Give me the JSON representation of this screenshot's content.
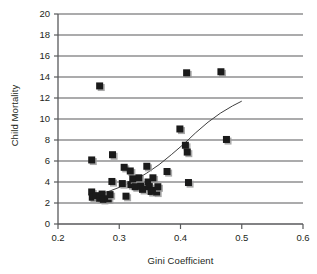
{
  "chart_data": {
    "type": "scatter",
    "title": "",
    "xlabel": "Gini Coefficient",
    "ylabel": "Child Mortality",
    "xlim": [
      0.2,
      0.6
    ],
    "ylim": [
      0,
      20
    ],
    "xticks": [
      "0.2",
      "0.3",
      "0.4",
      "0.5",
      "0.6"
    ],
    "xtick_values": [
      0.2,
      0.3,
      0.4,
      0.5,
      0.6
    ],
    "yticks": [
      "0",
      "2",
      "4",
      "6",
      "8",
      "10",
      "12",
      "14",
      "16",
      "18",
      "20"
    ],
    "ytick_values": [
      0,
      2,
      4,
      6,
      8,
      10,
      12,
      14,
      16,
      18,
      20
    ],
    "grid": "horizontal",
    "legend": "none",
    "marker": "filled-square-with-shadow",
    "marker_color": "#1a1a1a",
    "marker_shadow_color": "#9a9a9a",
    "gridline_color": "#58595b",
    "axis_color": "#58595b",
    "trendline_color": "#3f3f3f",
    "points": [
      {
        "x": 0.255,
        "y": 6.1
      },
      {
        "x": 0.268,
        "y": 13.15
      },
      {
        "x": 0.255,
        "y": 3.05
      },
      {
        "x": 0.256,
        "y": 2.55
      },
      {
        "x": 0.262,
        "y": 2.7
      },
      {
        "x": 0.268,
        "y": 2.45
      },
      {
        "x": 0.272,
        "y": 2.85
      },
      {
        "x": 0.274,
        "y": 2.35
      },
      {
        "x": 0.282,
        "y": 2.4
      },
      {
        "x": 0.285,
        "y": 2.8
      },
      {
        "x": 0.288,
        "y": 4.05
      },
      {
        "x": 0.289,
        "y": 6.6
      },
      {
        "x": 0.305,
        "y": 3.85
      },
      {
        "x": 0.308,
        "y": 5.4
      },
      {
        "x": 0.311,
        "y": 2.65
      },
      {
        "x": 0.318,
        "y": 5.05
      },
      {
        "x": 0.319,
        "y": 3.75
      },
      {
        "x": 0.322,
        "y": 4.3
      },
      {
        "x": 0.326,
        "y": 3.55
      },
      {
        "x": 0.332,
        "y": 4.4
      },
      {
        "x": 0.335,
        "y": 3.6
      },
      {
        "x": 0.338,
        "y": 3.3
      },
      {
        "x": 0.345,
        "y": 5.5
      },
      {
        "x": 0.347,
        "y": 4.0
      },
      {
        "x": 0.349,
        "y": 3.55
      },
      {
        "x": 0.352,
        "y": 3.1
      },
      {
        "x": 0.355,
        "y": 4.4
      },
      {
        "x": 0.358,
        "y": 3.2
      },
      {
        "x": 0.361,
        "y": 3.05
      },
      {
        "x": 0.363,
        "y": 3.55
      },
      {
        "x": 0.378,
        "y": 5.0
      },
      {
        "x": 0.399,
        "y": 9.05
      },
      {
        "x": 0.408,
        "y": 7.5
      },
      {
        "x": 0.41,
        "y": 14.4
      },
      {
        "x": 0.411,
        "y": 6.85
      },
      {
        "x": 0.413,
        "y": 3.95
      },
      {
        "x": 0.466,
        "y": 14.5
      },
      {
        "x": 0.475,
        "y": 8.05
      }
    ],
    "trendline": {
      "label": "fitted curve",
      "points": [
        {
          "x": 0.264,
          "y": 2.75
        },
        {
          "x": 0.285,
          "y": 3.15
        },
        {
          "x": 0.305,
          "y": 3.6
        },
        {
          "x": 0.325,
          "y": 4.15
        },
        {
          "x": 0.345,
          "y": 4.85
        },
        {
          "x": 0.365,
          "y": 5.65
        },
        {
          "x": 0.385,
          "y": 6.6
        },
        {
          "x": 0.405,
          "y": 7.6
        },
        {
          "x": 0.425,
          "y": 8.7
        },
        {
          "x": 0.445,
          "y": 9.7
        },
        {
          "x": 0.465,
          "y": 10.55
        },
        {
          "x": 0.485,
          "y": 11.25
        },
        {
          "x": 0.5,
          "y": 11.7
        }
      ]
    }
  }
}
